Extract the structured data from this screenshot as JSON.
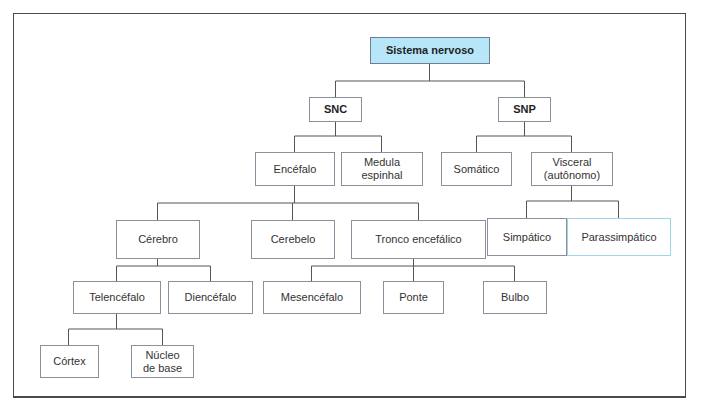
{
  "diagram": {
    "type": "hierarchy-tree",
    "colors": {
      "root_fill": "#b6e6f8",
      "box_border": "#8e8f9c",
      "highlight_border": "#9fd3ea",
      "line": "#555555",
      "frame": "#4a4a4a"
    },
    "nodes": {
      "sistema_nervoso": "Sistema nervoso",
      "snc": "SNC",
      "snp": "SNP",
      "encefalo": "Encéfalo",
      "medula_espinhal": "Medula\nespinhal",
      "somatico": "Somático",
      "visceral": "Visceral\n(autônomo)",
      "cerebro": "Cérebro",
      "cerebelo": "Cerebelo",
      "tronco_encefalico": "Tronco encefálico",
      "simpatico": "Simpático",
      "parassimpatico": "Parassimpático",
      "telencefalo": "Telencéfalo",
      "diencefalo": "Diencéfalo",
      "mesencefalo": "Mesencéfalo",
      "ponte": "Ponte",
      "bulbo": "Bulbo",
      "cortex": "Córtex",
      "nucleo_de_base": "Núcleo\nde base"
    },
    "edges": [
      [
        "Sistema nervoso",
        "SNC"
      ],
      [
        "Sistema nervoso",
        "SNP"
      ],
      [
        "SNC",
        "Encéfalo"
      ],
      [
        "SNC",
        "Medula espinhal"
      ],
      [
        "SNP",
        "Somático"
      ],
      [
        "SNP",
        "Visceral (autônomo)"
      ],
      [
        "Encéfalo",
        "Cérebro"
      ],
      [
        "Encéfalo",
        "Cerebelo"
      ],
      [
        "Encéfalo",
        "Tronco encefálico"
      ],
      [
        "Visceral (autônomo)",
        "Simpático"
      ],
      [
        "Visceral (autônomo)",
        "Parassimpático"
      ],
      [
        "Cérebro",
        "Telencéfalo"
      ],
      [
        "Cérebro",
        "Diencéfalo"
      ],
      [
        "Tronco encefálico",
        "Mesencéfalo"
      ],
      [
        "Tronco encefálico",
        "Ponte"
      ],
      [
        "Tronco encefálico",
        "Bulbo"
      ],
      [
        "Telencéfalo",
        "Córtex"
      ],
      [
        "Telencéfalo",
        "Núcleo de base"
      ]
    ]
  }
}
